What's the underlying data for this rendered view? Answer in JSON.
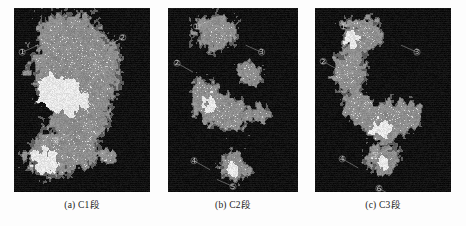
{
  "figure": {
    "background_color": "#fdfdfd",
    "panel_background_color": "#040404",
    "fill_color": "#8a8a8a",
    "highlight_color": "#e6e6e6",
    "midtone_color": "#5a5a5a",
    "annotation_color": "#cfcfcf",
    "panels": [
      {
        "id": "panel-a",
        "caption": "(a) C1段",
        "label": "(a)",
        "name": "C1段",
        "coverage_note": "large contiguous gray body with dense bright speckle core"
      },
      {
        "id": "panel-b",
        "caption": "(b) C2段",
        "label": "(b)",
        "name": "C2段",
        "coverage_note": "sparse fragmented gray patches with circled numeric markers"
      },
      {
        "id": "panel-c",
        "caption": "(c) C3段",
        "label": "(c)",
        "name": "C3段",
        "coverage_note": "scattered medium patches with circled numeric markers"
      }
    ]
  },
  "chart_data": {
    "type": "heatmap",
    "title": "",
    "xlabel": "",
    "ylabel": "",
    "grid": false,
    "legend_position": "none",
    "panel_count": 3,
    "categories": [
      "C1段",
      "C2段",
      "C3段"
    ],
    "series": [
      {
        "name": "背景 (background)",
        "values": [
          52,
          80,
          76
        ]
      },
      {
        "name": "灰色区 (gray region)",
        "values": [
          38,
          14,
          17
        ]
      },
      {
        "name": "亮斑 (bright speckle)",
        "values": [
          10,
          6,
          7
        ]
      }
    ],
    "value_unit": "percent of panel area",
    "panels": [
      {
        "caption": "(a) C1段",
        "blobs": [
          {
            "cx": 0.4,
            "cy": 0.14,
            "rx": 0.22,
            "ry": 0.12,
            "tone": "fill"
          },
          {
            "cx": 0.33,
            "cy": 0.36,
            "rx": 0.2,
            "ry": 0.16,
            "tone": "fill"
          },
          {
            "cx": 0.58,
            "cy": 0.33,
            "rx": 0.19,
            "ry": 0.15,
            "tone": "fill"
          },
          {
            "cx": 0.5,
            "cy": 0.56,
            "rx": 0.18,
            "ry": 0.16,
            "tone": "fill"
          },
          {
            "cx": 0.45,
            "cy": 0.74,
            "rx": 0.14,
            "ry": 0.13,
            "tone": "fill"
          },
          {
            "cx": 0.24,
            "cy": 0.8,
            "rx": 0.15,
            "ry": 0.11,
            "tone": "fill"
          },
          {
            "cx": 0.3,
            "cy": 0.45,
            "rx": 0.14,
            "ry": 0.12,
            "tone": "bright"
          },
          {
            "cx": 0.44,
            "cy": 0.5,
            "rx": 0.1,
            "ry": 0.08,
            "tone": "bright"
          },
          {
            "cx": 0.22,
            "cy": 0.83,
            "rx": 0.11,
            "ry": 0.08,
            "tone": "bright"
          },
          {
            "cx": 0.68,
            "cy": 0.8,
            "rx": 0.06,
            "ry": 0.04,
            "tone": "fill"
          }
        ],
        "markers": [
          {
            "x": 0.06,
            "y": 0.24,
            "text": "①"
          },
          {
            "x": 0.8,
            "y": 0.16,
            "text": "②"
          },
          {
            "x": 0.31,
            "y": 0.72,
            "text": "③"
          }
        ]
      },
      {
        "caption": "(b) C2段",
        "blobs": [
          {
            "cx": 0.37,
            "cy": 0.13,
            "rx": 0.15,
            "ry": 0.1,
            "tone": "fill"
          },
          {
            "cx": 0.28,
            "cy": 0.48,
            "rx": 0.12,
            "ry": 0.1,
            "tone": "fill"
          },
          {
            "cx": 0.47,
            "cy": 0.58,
            "rx": 0.15,
            "ry": 0.09,
            "tone": "fill"
          },
          {
            "cx": 0.64,
            "cy": 0.35,
            "rx": 0.11,
            "ry": 0.06,
            "tone": "fill"
          },
          {
            "cx": 0.72,
            "cy": 0.57,
            "rx": 0.08,
            "ry": 0.05,
            "tone": "fill"
          },
          {
            "cx": 0.5,
            "cy": 0.86,
            "rx": 0.11,
            "ry": 0.08,
            "tone": "fill"
          },
          {
            "cx": 0.33,
            "cy": 0.52,
            "rx": 0.07,
            "ry": 0.05,
            "tone": "bright"
          },
          {
            "cx": 0.49,
            "cy": 0.88,
            "rx": 0.06,
            "ry": 0.04,
            "tone": "bright"
          }
        ],
        "markers": [
          {
            "x": 0.22,
            "y": 0.1,
            "text": "①"
          },
          {
            "x": 0.07,
            "y": 0.3,
            "text": "②"
          },
          {
            "x": 0.72,
            "y": 0.24,
            "text": "③"
          },
          {
            "x": 0.2,
            "y": 0.83,
            "text": "④"
          },
          {
            "x": 0.5,
            "y": 0.97,
            "text": "⑤"
          }
        ]
      },
      {
        "caption": "(c) C3段",
        "blobs": [
          {
            "cx": 0.34,
            "cy": 0.15,
            "rx": 0.14,
            "ry": 0.1,
            "tone": "fill"
          },
          {
            "cx": 0.25,
            "cy": 0.36,
            "rx": 0.11,
            "ry": 0.1,
            "tone": "fill"
          },
          {
            "cx": 0.31,
            "cy": 0.55,
            "rx": 0.1,
            "ry": 0.07,
            "tone": "fill"
          },
          {
            "cx": 0.53,
            "cy": 0.63,
            "rx": 0.14,
            "ry": 0.09,
            "tone": "fill"
          },
          {
            "cx": 0.67,
            "cy": 0.58,
            "rx": 0.09,
            "ry": 0.07,
            "tone": "fill"
          },
          {
            "cx": 0.48,
            "cy": 0.82,
            "rx": 0.12,
            "ry": 0.08,
            "tone": "fill"
          },
          {
            "cx": 0.28,
            "cy": 0.17,
            "rx": 0.07,
            "ry": 0.05,
            "tone": "bright"
          },
          {
            "cx": 0.5,
            "cy": 0.66,
            "rx": 0.08,
            "ry": 0.05,
            "tone": "bright"
          },
          {
            "cx": 0.47,
            "cy": 0.83,
            "rx": 0.07,
            "ry": 0.05,
            "tone": "bright"
          }
        ],
        "markers": [
          {
            "x": 0.21,
            "y": 0.1,
            "text": "①"
          },
          {
            "x": 0.06,
            "y": 0.29,
            "text": "②"
          },
          {
            "x": 0.75,
            "y": 0.24,
            "text": "③"
          },
          {
            "x": 0.2,
            "y": 0.82,
            "text": "④"
          },
          {
            "x": 0.44,
            "y": 0.8,
            "text": "⑤"
          },
          {
            "x": 0.47,
            "y": 0.98,
            "text": "⑥"
          }
        ]
      }
    ]
  }
}
